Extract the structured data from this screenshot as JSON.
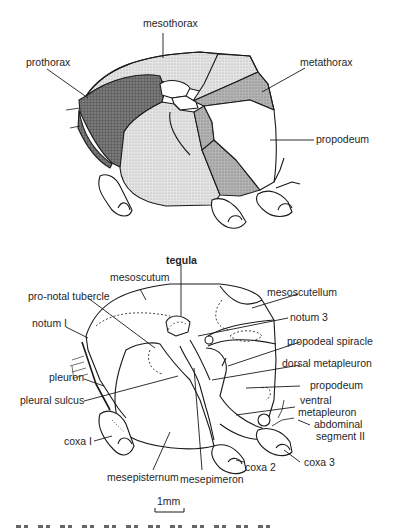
{
  "figure": {
    "top_diagram": {
      "description": "Lateral view of thorax with shaded regions",
      "labels": {
        "mesothorax": "mesothorax",
        "prothorax": "prothorax",
        "metathorax": "metathorax",
        "propodeum": "propodeum"
      },
      "colors": {
        "prothorax_fill": "#6e6e6e",
        "mesothorax_fill": "#dcdcdc",
        "metathorax_fill": "#a8a8a8",
        "propodeum_fill": "#ffffff",
        "outline": "#1a1a1a"
      }
    },
    "bottom_diagram": {
      "description": "Lateral view of thorax with labeled sclerites",
      "labels": {
        "tegula": "tegula",
        "mesoscutum": "mesoscutum",
        "pronotal_tubercle": "pro-notal tubercle",
        "mesoscutellum": "mesoscutellum",
        "notum1": "notum I",
        "notum3": "notum 3",
        "propodeal_spiracle": "propodeal spiracle",
        "dorsal_metapleuron": "dorsal metapleuron",
        "pleuron": "pleuron",
        "pleural_sulcus": "pleural sulcus",
        "propodeum": "propodeum",
        "ventral_metapleuron_1": "ventral",
        "ventral_metapleuron_2": "metapleuron",
        "abdominal_segment_1": "abdominal",
        "abdominal_segment_2": "segment II",
        "coxa1": "coxa I",
        "coxa2": "coxa 2",
        "coxa3": "coxa 3",
        "mesepisternum": "mesepisternum",
        "mesepimeron": "mesepimeron"
      }
    },
    "scale_bar": {
      "label": "1mm"
    }
  }
}
